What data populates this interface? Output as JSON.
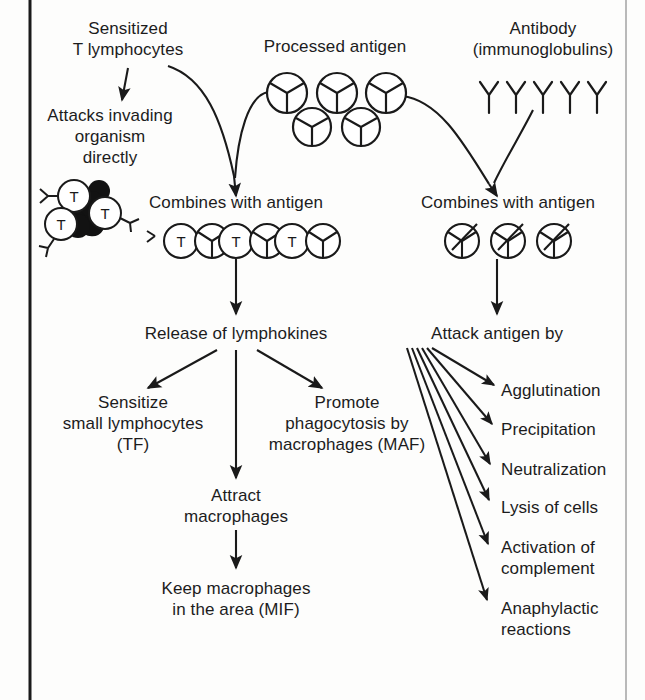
{
  "diagram": {
    "background_color": "#fdfdfc",
    "ink_color": "#1a1a1a",
    "border": {
      "left_rule": true,
      "right_rule": true
    }
  },
  "labels": {
    "sensitized_t_lymphocytes": "Sensitized\nT lymphocytes",
    "processed_antigen": "Processed antigen",
    "antibody": "Antibody\n(immunoglobulins)",
    "attacks_invading": "Attacks invading\norganism\ndirectly",
    "combines_with_antigen_left": "Combines with antigen",
    "combines_with_antigen_right": "Combines with antigen",
    "release_of_lymphokines": "Release of lymphokines",
    "attack_antigen_by": "Attack antigen by",
    "sensitize_small_lymphocytes": "Sensitize\nsmall lymphocytes\n(TF)",
    "promote_phagocytosis": "Promote\nphagocytosis by\nmacrophages (MAF)",
    "attract_macrophages": "Attract\nmacrophages",
    "keep_macrophages": "Keep macrophages\nin the area (MIF)"
  },
  "attack_mechanisms": [
    "Agglutination",
    "Precipitation",
    "Neutralization",
    "Lysis of cells",
    "Activation of\ncomplement",
    "Anaphylactic\nreactions"
  ],
  "symbols": {
    "t_cell_letter": "T",
    "antigen_glyph": "circle-with-inscribed-Y",
    "antibody_glyph": "Y-shape",
    "t_cell_cluster": {
      "t_cell_count": 3,
      "invading_organism": "black-blob"
    },
    "processed_antigen_cluster": {
      "top_row_count": 3,
      "bottom_row_count": 2
    },
    "antibody_row_count": 5,
    "t_antigen_complex_count": 3,
    "antibody_antigen_complex_count": 3
  }
}
